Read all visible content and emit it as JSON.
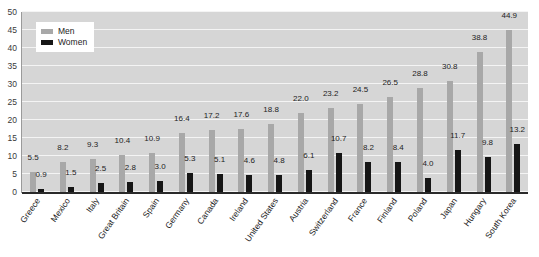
{
  "chart_data": {
    "type": "bar",
    "title": "",
    "xlabel": "",
    "ylabel": "",
    "ylim": [
      0,
      50
    ],
    "ytick_step": 5,
    "yticks": [
      0,
      5,
      10,
      15,
      20,
      25,
      30,
      35,
      40,
      45,
      50
    ],
    "grid": true,
    "legend_position": "top-left",
    "categories": [
      "Greece",
      "Mexico",
      "Italy",
      "Great Britain",
      "Spain",
      "Germany",
      "Canada",
      "Ireland",
      "United States",
      "Austria",
      "Switzerland",
      "France",
      "Finland",
      "Poland",
      "Japan",
      "Hungary",
      "South Korea"
    ],
    "series": [
      {
        "name": "Men",
        "color": "#a8a8a8",
        "values": [
          5.5,
          8.2,
          9.3,
          10.4,
          10.9,
          16.4,
          17.2,
          17.6,
          18.8,
          22.0,
          23.2,
          24.5,
          26.5,
          28.8,
          30.8,
          38.8,
          44.9
        ]
      },
      {
        "name": "Women",
        "color": "#161616",
        "values": [
          0.9,
          1.5,
          2.5,
          2.8,
          3.0,
          5.3,
          5.1,
          4.6,
          4.8,
          6.1,
          10.7,
          8.2,
          8.4,
          4.0,
          11.7,
          9.8,
          13.2
        ]
      }
    ]
  },
  "legend": {
    "items": [
      {
        "label": "Men",
        "swatch": "men"
      },
      {
        "label": "Women",
        "swatch": "women"
      }
    ]
  },
  "colors": {
    "men": "#a8a8a8",
    "women": "#161616",
    "plot_background": "#d6d6d6",
    "gridline": "#f4f4f4",
    "axis": "#2a2a2a",
    "text": "#1d1d1d"
  }
}
